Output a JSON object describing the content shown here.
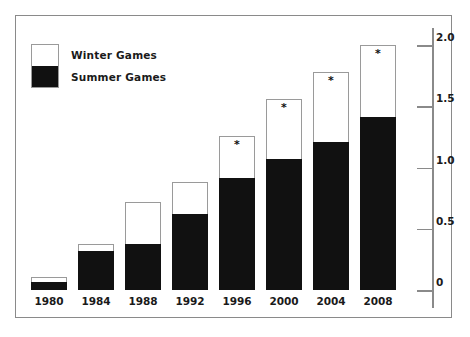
{
  "chart_data": {
    "type": "bar",
    "title": "",
    "subtitle": "",
    "xlabel": "",
    "ylabel": "",
    "stacked": true,
    "grid": false,
    "legend_position": "top-left",
    "categories": [
      "1980",
      "1984",
      "1988",
      "1992",
      "1996",
      "2000",
      "2004",
      "2008"
    ],
    "ylim": [
      0,
      2.0
    ],
    "yticks": [
      "0",
      "0.5",
      "1.0",
      "1.5",
      "2.0"
    ],
    "ytick_values": [
      0,
      0.5,
      1.0,
      1.5,
      2.0
    ],
    "series": [
      {
        "name": "Summer Games",
        "color": "#111111",
        "values": [
          0.07,
          0.32,
          0.38,
          0.62,
          0.92,
          1.07,
          1.21,
          1.41
        ]
      },
      {
        "name": "Winter Games",
        "color": "#ffffff",
        "values": [
          0.04,
          0.06,
          0.34,
          0.26,
          0.34,
          0.49,
          0.57,
          0.59
        ]
      }
    ],
    "totals": [
      0.11,
      0.38,
      0.72,
      0.88,
      1.26,
      1.56,
      1.78,
      2.0
    ],
    "annotations": [
      {
        "category": "1996",
        "marker": "*"
      },
      {
        "category": "2000",
        "marker": "*"
      },
      {
        "category": "2004",
        "marker": "*"
      },
      {
        "category": "2008",
        "marker": "*"
      }
    ]
  },
  "legend": {
    "items": [
      {
        "label": "Winter Games",
        "swatch": "winter"
      },
      {
        "label": "Summer Games",
        "swatch": "summer"
      }
    ]
  },
  "axis": {
    "ticks": [
      {
        "label": "2.0",
        "value": 2.0
      },
      {
        "label": "1.5",
        "value": 1.5
      },
      {
        "label": "1.0",
        "value": 1.0
      },
      {
        "label": "0.5",
        "value": 0.5
      },
      {
        "label": "0",
        "value": 0
      }
    ]
  },
  "bars": [
    {
      "year": "1980",
      "summer": 0.07,
      "winter": 0.04,
      "star": ""
    },
    {
      "year": "1984",
      "summer": 0.32,
      "winter": 0.06,
      "star": ""
    },
    {
      "year": "1988",
      "summer": 0.38,
      "winter": 0.34,
      "star": ""
    },
    {
      "year": "1992",
      "summer": 0.62,
      "winter": 0.26,
      "star": ""
    },
    {
      "year": "1996",
      "summer": 0.92,
      "winter": 0.34,
      "star": "*"
    },
    {
      "year": "2000",
      "summer": 1.07,
      "winter": 0.49,
      "star": "*"
    },
    {
      "year": "2004",
      "summer": 1.21,
      "winter": 0.57,
      "star": "*"
    },
    {
      "year": "2008",
      "summer": 1.41,
      "winter": 0.59,
      "star": "*"
    }
  ],
  "colors": {
    "summer": "#111111",
    "winter": "#ffffff",
    "frame": "#8a8a8a",
    "text": "#1a1a1a"
  }
}
